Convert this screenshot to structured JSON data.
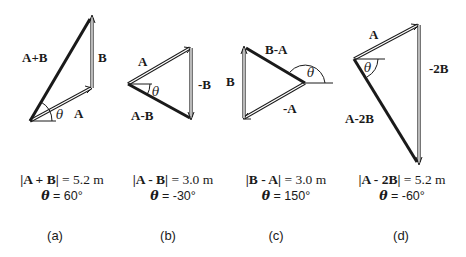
{
  "figure": {
    "panels": [
      {
        "id": "a",
        "tag": "(a)",
        "labels": {
          "result": "A+B",
          "v1": "B",
          "v2": "A",
          "theta": "θ"
        },
        "magnitude_expr": "|A + B|",
        "magnitude_value": "= 5.2 m",
        "angle_symbol": "θ",
        "angle_value": "= 60°"
      },
      {
        "id": "b",
        "tag": "(b)",
        "labels": {
          "result": "A-B",
          "v1": "A",
          "v2": "-B",
          "theta": "θ"
        },
        "magnitude_expr": "|A - B|",
        "magnitude_value": "= 3.0 m",
        "angle_symbol": "θ",
        "angle_value": "= -30°"
      },
      {
        "id": "c",
        "tag": "(c)",
        "labels": {
          "result": "B-A",
          "v1": "B",
          "v2": "-A",
          "theta": "θ"
        },
        "magnitude_expr": "|B - A|",
        "magnitude_value": "= 3.0 m",
        "angle_symbol": "θ",
        "angle_value": "= 150°"
      },
      {
        "id": "d",
        "tag": "(d)",
        "labels": {
          "result": "A-2B",
          "v1": "A",
          "v2": "-2B",
          "theta": "θ"
        },
        "magnitude_expr": "|A - 2B|",
        "magnitude_value": "= 5.2 m",
        "angle_symbol": "θ",
        "angle_value": "= -60°"
      }
    ],
    "colors": {
      "ink": "#1a1a1a",
      "background": "#ffffff"
    }
  }
}
